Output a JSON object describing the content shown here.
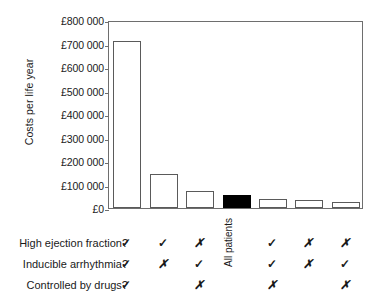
{
  "chart_data": {
    "type": "bar",
    "title": "",
    "xlabel": "",
    "ylabel": "Costs per life year",
    "ylim": [
      0,
      800000
    ],
    "grid": false,
    "legend": "none",
    "ytick_labels": [
      "£800 000",
      "£700 000",
      "£600 000",
      "£500 000",
      "£400 000",
      "£300 000",
      "£200 000",
      "£100 000",
      "£0"
    ],
    "ytick_values": [
      800000,
      700000,
      600000,
      500000,
      400000,
      300000,
      200000,
      100000,
      0
    ],
    "categories": [
      "1",
      "2",
      "3",
      "4",
      "5",
      "6",
      "7"
    ],
    "values": [
      710000,
      145000,
      72000,
      57000,
      40000,
      33000,
      25000
    ],
    "bar_colors": [
      "#ffffff",
      "#ffffff",
      "#ffffff",
      "#000000",
      "#ffffff",
      "#ffffff",
      "#ffffff"
    ],
    "bar_edge_color": "#5a5a5a",
    "highlight_index": 3,
    "highlight_label": "All patients"
  },
  "axis": {
    "ylabel": "Costs per life year",
    "ticks": [
      {
        "label": "£800 000",
        "value": 800000
      },
      {
        "label": "£700 000",
        "value": 700000
      },
      {
        "label": "£600 000",
        "value": 600000
      },
      {
        "label": "£500 000",
        "value": 500000
      },
      {
        "label": "£400 000",
        "value": 400000
      },
      {
        "label": "£300 000",
        "value": 300000
      },
      {
        "label": "£200 000",
        "value": 200000
      },
      {
        "label": "£100 000",
        "value": 100000
      },
      {
        "label": "£0",
        "value": 0
      }
    ]
  },
  "table": {
    "rows": [
      {
        "label": "High ejection fraction?",
        "marks": [
          "check",
          "check",
          "cross",
          "",
          "check",
          "cross",
          "cross"
        ]
      },
      {
        "label": "Inducible arrhythmia?",
        "marks": [
          "check",
          "cross",
          "check",
          "",
          "check",
          "cross",
          "check"
        ]
      },
      {
        "label": "Controlled by drugs?",
        "marks": [
          "check",
          "",
          "cross",
          "",
          "cross",
          "",
          "cross"
        ]
      }
    ],
    "column_annotation": "All patients",
    "glyphs": {
      "check": "✓",
      "cross": "✗"
    }
  }
}
